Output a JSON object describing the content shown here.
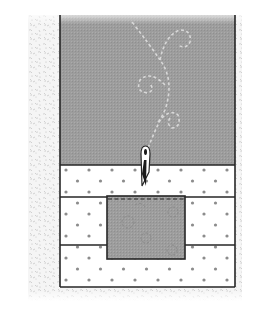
{
  "diagram": {
    "colors": {
      "background": "#ffffff",
      "speckle_bg": "#f4f4f4",
      "speckle_fleck": "#c8c8c8",
      "gray_panel": "#9c9c9c",
      "outline": "#2a2a2a",
      "dot": "#8a8a8a",
      "dotted_panel": "#ffffff",
      "swirl": "#d6d6d6",
      "center_square": "#a4a4a4",
      "center_swirl": "#8e8e8e"
    },
    "regions": {
      "speckled_border": {
        "x": 28,
        "y": 15,
        "w": 214,
        "h": 286
      },
      "top_gray_panel": {
        "x": 60,
        "y": 15,
        "w": 175,
        "h": 150
      },
      "dotted_strips": [
        {
          "x": 60,
          "y": 165,
          "w": 175,
          "h": 32
        },
        {
          "x": 60,
          "y": 197,
          "w": 175,
          "h": 48
        },
        {
          "x": 60,
          "y": 245,
          "w": 175,
          "h": 42
        }
      ],
      "center_square": {
        "x": 107,
        "y": 196,
        "w": 78,
        "h": 63
      },
      "needle": {
        "x": 145,
        "y_top": 148,
        "y_tip": 186
      }
    }
  }
}
